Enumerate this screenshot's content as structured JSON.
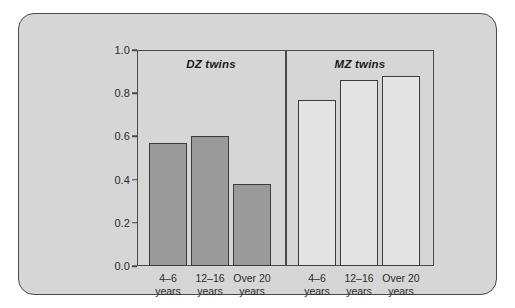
{
  "chart_data": {
    "type": "bar",
    "title": "",
    "subtitle": "",
    "xlabel": "",
    "ylabel": "",
    "ylim": [
      0.0,
      1.0
    ],
    "grid": false,
    "legend_position": "none",
    "y_ticks": [
      "0.0",
      "0.2",
      "0.4",
      "0.6",
      "0.8",
      "1.0"
    ],
    "y_tick_values": [
      0.0,
      0.2,
      0.4,
      0.6,
      0.8,
      1.0
    ],
    "categories": [
      "4–6 years",
      "12–16 years",
      "Over 20 years"
    ],
    "panels": [
      {
        "name": "DZ twins",
        "fill": "#9a9a9a",
        "bars": [
          {
            "label_line1": "4–6",
            "label_line2": "years",
            "value": 0.57
          },
          {
            "label_line1": "12–16",
            "label_line2": "years",
            "value": 0.6
          },
          {
            "label_line1": "Over 20",
            "label_line2": "years",
            "value": 0.38
          }
        ]
      },
      {
        "name": "MZ twins",
        "fill": "#e4e4e4",
        "bars": [
          {
            "label_line1": "4–6",
            "label_line2": "years",
            "value": 0.77
          },
          {
            "label_line1": "12–16",
            "label_line2": "years",
            "value": 0.86
          },
          {
            "label_line1": "Over 20",
            "label_line2": "years",
            "value": 0.88
          }
        ]
      }
    ],
    "series": [
      {
        "name": "DZ twins",
        "values": [
          0.57,
          0.6,
          0.38
        ]
      },
      {
        "name": "MZ twins",
        "values": [
          0.77,
          0.86,
          0.88
        ]
      }
    ]
  },
  "panel_titles": {
    "dz": "DZ twins",
    "mz": "MZ twins"
  },
  "axis": {
    "y": {
      "t0": "0.0",
      "t1": "0.2",
      "t2": "0.4",
      "t3": "0.6",
      "t4": "0.8",
      "t5": "1.0"
    }
  },
  "bar_labels": {
    "dz1_l1": "4–6",
    "dz1_l2": "years",
    "dz2_l1": "12–16",
    "dz2_l2": "years",
    "dz3_l1": "Over 20",
    "dz3_l2": "years",
    "mz1_l1": "4–6",
    "mz1_l2": "years",
    "mz2_l1": "12–16",
    "mz2_l2": "years",
    "mz3_l1": "Over 20",
    "mz3_l2": "years"
  },
  "colors": {
    "card_background": "#d6d6d6",
    "card_border": "#4a4a4a",
    "axis": "#4a4a4a",
    "dz_bar_fill": "#9a9a9a",
    "mz_bar_fill": "#e4e4e4",
    "bar_outline": "#3c3c3c",
    "text": "#2b2b2b"
  }
}
